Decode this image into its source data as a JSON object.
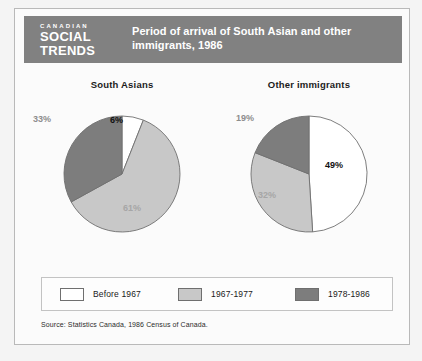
{
  "masthead": {
    "kicker": "CANADIAN",
    "line1": "SOCIAL",
    "line2": "TRENDS"
  },
  "header": {
    "title": "Period of arrival of South Asian and other immigrants, 1986",
    "bar_color": "#818181"
  },
  "legend": {
    "items": [
      {
        "label": "Before 1967",
        "color": "#ffffff"
      },
      {
        "label": "1967-1977",
        "color": "#c8c8c8"
      },
      {
        "label": "1978-1986",
        "color": "#7d7d7d"
      }
    ]
  },
  "source": {
    "text": "Source: Statistics Canada, 1986 Census of Canada."
  },
  "chart_data": [
    {
      "type": "pie",
      "title": "South Asians",
      "categories": [
        "Before 1967",
        "1967-1977",
        "1978-1986"
      ],
      "values": [
        6,
        61,
        33
      ],
      "labels": [
        "6%",
        "61%",
        "33%"
      ],
      "colors": [
        "#ffffff",
        "#c8c8c8",
        "#7d7d7d"
      ],
      "units": "percent",
      "start_angle_deg": 0,
      "direction": "clockwise"
    },
    {
      "type": "pie",
      "title": "Other immigrants",
      "categories": [
        "Before 1967",
        "1967-1977",
        "1978-1986"
      ],
      "values": [
        49,
        32,
        19
      ],
      "labels": [
        "49%",
        "32%",
        "19%"
      ],
      "colors": [
        "#ffffff",
        "#c8c8c8",
        "#7d7d7d"
      ],
      "units": "percent",
      "start_angle_deg": 0,
      "direction": "clockwise"
    }
  ]
}
